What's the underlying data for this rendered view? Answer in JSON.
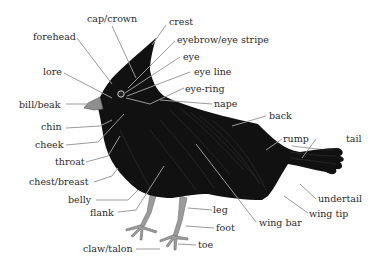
{
  "diagram": {
    "colors": {
      "body": "#111111",
      "leader": "#9a9a9a",
      "text": "#2a2a2a",
      "legs": "#9b9b9b",
      "background": "#ffffff"
    },
    "labels": {
      "cap_crown": "cap/crown",
      "crest": "crest",
      "forehead": "forehead",
      "eyebrow": "eyebrow/eye stripe",
      "eye": "eye",
      "lore": "lore",
      "eye_line": "eye line",
      "eye_ring": "eye-ring",
      "bill": "bill/beak",
      "nape": "nape",
      "back": "back",
      "chin": "chin",
      "cheek": "cheek",
      "rump": "rump",
      "tail": "tail",
      "throat": "throat",
      "chest": "chest/breast",
      "undertail": "undertail",
      "belly": "belly",
      "wing_tip": "wing tip",
      "flank": "flank",
      "leg": "leg",
      "foot": "foot",
      "wing_bar": "wing bar",
      "claw": "claw/talon",
      "toe": "toe"
    }
  }
}
